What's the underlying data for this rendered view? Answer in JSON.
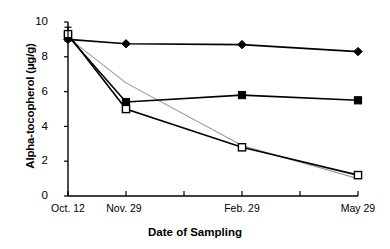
{
  "chart_data": {
    "type": "line",
    "title": "",
    "xlabel": "Date of Sampling",
    "ylabel": "Alpha-tocopherol (µg/g)",
    "categories": [
      "Oct. 12",
      "Nov. 29",
      "Feb. 29",
      "May 29"
    ],
    "x": [
      0,
      1,
      3,
      5
    ],
    "xlim": [
      0,
      5
    ],
    "ylim": [
      0,
      10
    ],
    "yticks": [
      0,
      2,
      4,
      6,
      8,
      10
    ],
    "ytick_labels": [
      "0",
      "2",
      "4",
      "6",
      "8",
      "10"
    ],
    "xtick_positions": [
      0,
      1,
      2,
      3,
      4,
      5
    ],
    "grid": false,
    "legend": "none",
    "series": [
      {
        "name": "filled-diamond",
        "marker": "filled-diamond",
        "color": "#000000",
        "values": [
          9.0,
          8.75,
          8.7,
          8.3
        ]
      },
      {
        "name": "filled-square",
        "marker": "filled-square",
        "color": "#000000",
        "values": [
          9.2,
          5.4,
          5.8,
          5.5
        ]
      },
      {
        "name": "open-square",
        "marker": "open-square",
        "color": "#000000",
        "values": [
          9.3,
          5.0,
          2.8,
          1.2
        ]
      },
      {
        "name": "gray-line",
        "marker": "none",
        "color": "#999999",
        "values": [
          9.1,
          6.5,
          2.9,
          1.0
        ]
      }
    ],
    "error_bars": [
      {
        "x": 0,
        "y": 9.2,
        "upper": 9.7,
        "lower": 8.9
      }
    ]
  }
}
